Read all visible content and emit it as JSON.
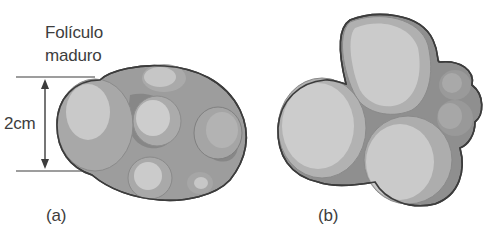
{
  "figure": {
    "panel_a": {
      "label_line1": "Folículo",
      "label_line2": "maduro",
      "dimension_label": "2cm",
      "caption": "(a)"
    },
    "panel_b": {
      "caption": "(b)"
    }
  },
  "colors": {
    "outline": "#3c3c3c",
    "tissue": "#9d9d9d",
    "tissue_dark": "#7e7e7e",
    "follicle": "#b8b8b8",
    "follicle_highlight": "#cfcfcf",
    "text": "#3d3d3d"
  }
}
